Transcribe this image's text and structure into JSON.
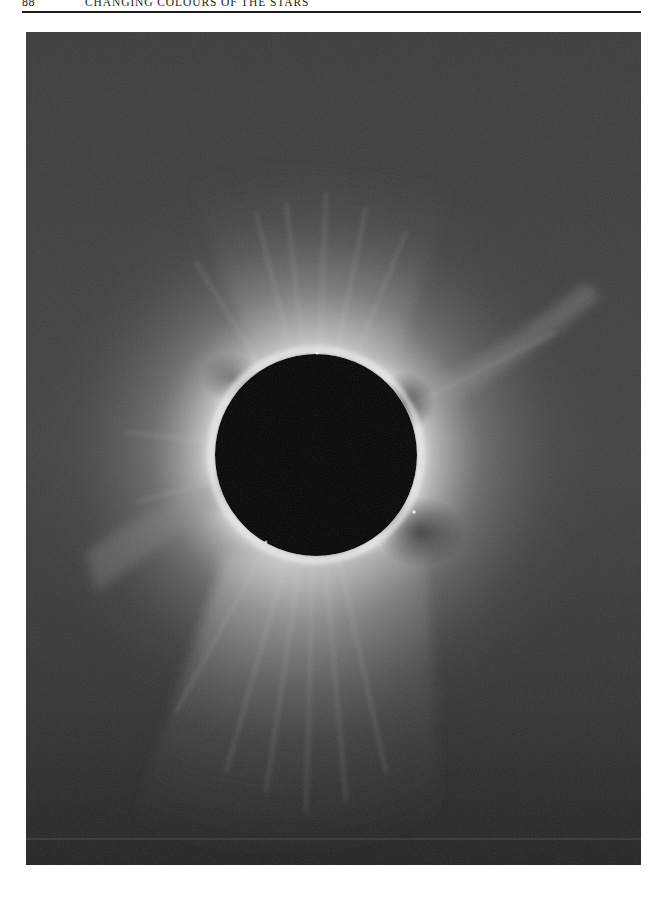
{
  "running_head": {
    "page_number": "88",
    "title": "Changing Colours of the Stars"
  },
  "plate": {
    "subject": "total-solar-eclipse-corona",
    "moon_center": [
      316,
      455
    ],
    "moon_radius": 101,
    "colors": {
      "background_top": "#3a3a3a",
      "background_bottom": "#262626",
      "corona_inner": "#d8d8d8",
      "corona_mid": "#8a8a8a",
      "moon": "#050505"
    }
  }
}
